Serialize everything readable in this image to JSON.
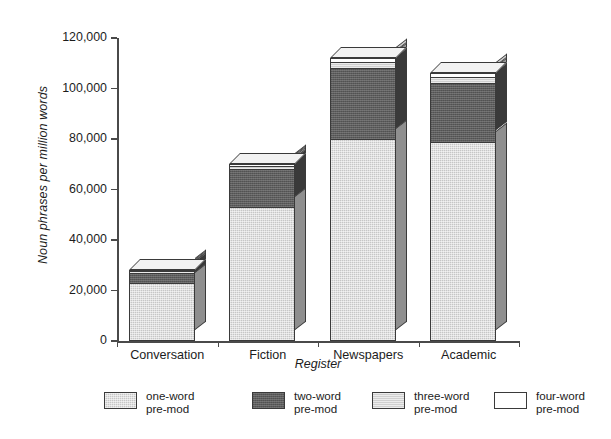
{
  "chart_data": {
    "type": "bar",
    "subtype": "stacked-3d-column",
    "title": "",
    "xlabel": "Register",
    "ylabel": "Noun phrases per million words",
    "categories": [
      "Conversation",
      "Fiction",
      "Newspapers",
      "Academic"
    ],
    "series": [
      {
        "name": "one-word pre-mod",
        "values": [
          23000,
          53000,
          80000,
          79000
        ]
      },
      {
        "name": "two-word pre-mod",
        "values": [
          4000,
          15000,
          28000,
          23000
        ]
      },
      {
        "name": "three-word pre-mod",
        "values": [
          700,
          1300,
          2500,
          2500
        ]
      },
      {
        "name": "four-word pre-mod",
        "values": [
          400,
          700,
          1500,
          1500
        ]
      }
    ],
    "totals": [
      28100,
      70000,
      112000,
      106000
    ],
    "ylim": [
      0,
      120000
    ],
    "ytick_values": [
      0,
      20000,
      40000,
      60000,
      80000,
      100000,
      120000
    ],
    "ytick_labels": [
      "0",
      "20,000",
      "40,000",
      "60,000",
      "80,000",
      "100,000",
      "120,000"
    ],
    "grid": false,
    "legend_position": "bottom",
    "colors": {
      "one_word": "#c6c6c6",
      "two_word": "#5d5d5d",
      "three_word": "#cfcfcf",
      "four_word": "#ffffff",
      "axis": "#4a4a4a",
      "outline": "#3a3a3a",
      "text": "#1c1c1c",
      "background": "#ffffff"
    }
  },
  "legend": {
    "items": [
      {
        "label_line1": "one-word",
        "label_line2": "pre-mod",
        "swatch": "one-word-swatch"
      },
      {
        "label_line1": "two-word",
        "label_line2": "pre-mod",
        "swatch": "two-word-swatch"
      },
      {
        "label_line1": "three-word",
        "label_line2": "pre-mod",
        "swatch": "three-word-swatch"
      },
      {
        "label_line1": "four-word",
        "label_line2": "pre-mod",
        "swatch": "four-word-swatch"
      }
    ]
  }
}
